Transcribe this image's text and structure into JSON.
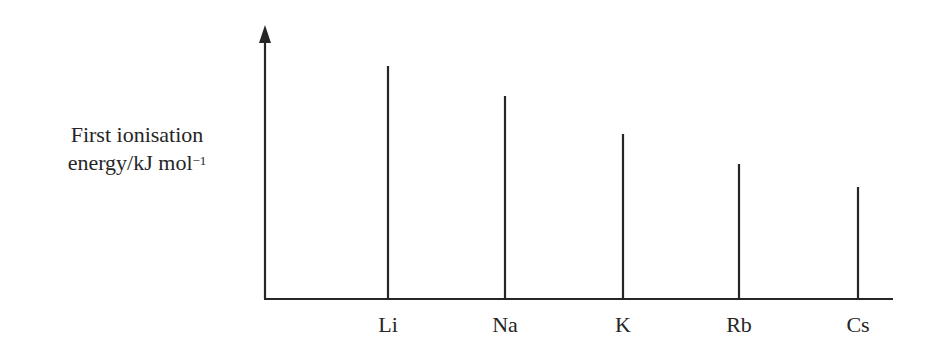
{
  "chart_data": {
    "type": "bar",
    "title": "",
    "ylabel_line1": "First ionisation",
    "ylabel_line2": "energy/kJ mol",
    "ylabel_sup": "−1",
    "xlabel": "",
    "categories": [
      "Li",
      "Na",
      "K",
      "Rb",
      "Cs"
    ],
    "values": [
      233,
      203,
      165,
      135,
      112
    ],
    "value_note": "Relative line heights (schematic, no numeric y-scale shown)",
    "ylim": [
      0,
      274
    ],
    "grid": false,
    "legend": null,
    "style": "vertical lines (stick chart) with arrowed y-axis"
  },
  "layout": {
    "axis_x0": 265,
    "axis_y0": 299,
    "axis_x1": 893,
    "axis_ytop": 25,
    "bar_x": [
      388,
      505,
      623,
      739,
      858
    ],
    "line_color": "#262626"
  }
}
